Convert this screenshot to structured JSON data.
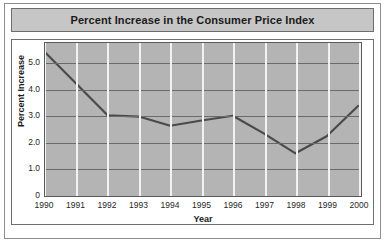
{
  "chart_data": {
    "type": "line",
    "title": "Percent Increase in the Consumer Price Index",
    "xlabel": "Year",
    "ylabel": "Percent Increase",
    "categories": [
      "1990",
      "1991",
      "1992",
      "1993",
      "1994",
      "1995",
      "1996",
      "1997",
      "1998",
      "1999",
      "2000"
    ],
    "values": [
      5.4,
      4.2,
      3.0,
      2.95,
      2.6,
      2.8,
      2.98,
      2.3,
      1.55,
      2.2,
      3.35
    ],
    "series": [
      {
        "name": "Percent Increase",
        "values": [
          5.4,
          4.2,
          3.0,
          2.95,
          2.6,
          2.8,
          2.98,
          2.3,
          1.55,
          2.2,
          3.35
        ]
      }
    ],
    "ylim": [
      0,
      5.75
    ],
    "xlim": [
      "1990",
      "2000"
    ],
    "yticks": [
      "0",
      "1.0",
      "2.0",
      "3.0",
      "4.0",
      "5.0"
    ],
    "ytick_values": [
      0,
      1.0,
      2.0,
      3.0,
      4.0,
      5.0
    ],
    "grid": "horizontal-and-vertical",
    "legend": "none",
    "line_color": "#4a4a4a",
    "plot_background": "#b4b4b4",
    "grid_color_horizontal": "#6a6a6a",
    "grid_color_vertical": "#f2f2f2",
    "title_background": "#c6c6c6",
    "text_color": "#1a1a1a"
  }
}
